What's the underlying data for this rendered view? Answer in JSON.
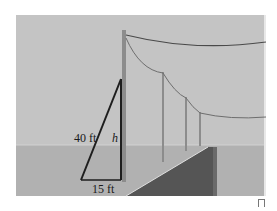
{
  "figure": {
    "labels": {
      "hypotenuse": "40 ft",
      "height": "h",
      "base": "15 ft"
    },
    "colors": {
      "sky": "#c4c4c4",
      "ground": "#b1b1b1",
      "ramp": "#555555",
      "triangle": "#1e1e1e",
      "pole": "#8c8c8c",
      "wire": "#6e6e6e"
    }
  }
}
